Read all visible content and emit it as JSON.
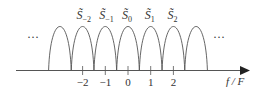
{
  "diagram": {
    "type": "periodic-spectrum",
    "axis_label": "f / F",
    "ellipsis_left": "···",
    "ellipsis_right": "···",
    "ticks": [
      {
        "label": "−2",
        "value": -2
      },
      {
        "label": "−1",
        "value": -1
      },
      {
        "label": "0",
        "value": 0
      },
      {
        "label": "1",
        "value": 1
      },
      {
        "label": "2",
        "value": 2
      }
    ],
    "lobes": [
      {
        "center": -3,
        "label": ""
      },
      {
        "center": -2,
        "label": "S̃",
        "sub": "−2"
      },
      {
        "center": -1,
        "label": "S̃",
        "sub": "−1"
      },
      {
        "center": 0,
        "label": "S̃",
        "sub": "0"
      },
      {
        "center": 1,
        "label": "S̃",
        "sub": "1"
      },
      {
        "center": 2,
        "label": "S̃",
        "sub": "2"
      },
      {
        "center": 3,
        "label": ""
      }
    ],
    "colors": {
      "line": "#555555",
      "text": "#333333"
    }
  }
}
